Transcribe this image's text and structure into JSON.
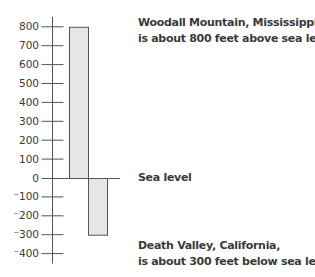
{
  "chart_data": {
    "type": "bar",
    "title": "",
    "xlabel": "",
    "ylabel": "",
    "categories": [
      "Woodall Mountain, Mississippi",
      "Death Valley, California"
    ],
    "values": [
      800,
      -300
    ],
    "ylim": [
      -400,
      800
    ],
    "yticks": [
      800,
      700,
      600,
      500,
      400,
      300,
      200,
      100,
      0,
      -100,
      -200,
      -300,
      -400
    ],
    "ytick_labels": [
      "800",
      "700",
      "600",
      "500",
      "400",
      "300",
      "200",
      "100",
      "0",
      "⁻100",
      "⁻200",
      "⁻300",
      "⁻400"
    ],
    "grid": false,
    "bar_fill": "#e6e6e6",
    "bar_stroke": "#555555",
    "annotations": [
      {
        "line1": "Woodall Mountain, Mississippi,",
        "line2": "is about 800 feet above sea level"
      },
      {
        "line1": "Sea level"
      },
      {
        "line1": "Death Valley, California,",
        "line2": "is about 300 feet below sea level"
      }
    ]
  },
  "labels": {
    "woodall_line1": "Woodall Mountain, Mississippi,",
    "woodall_line2": "is about 800 feet above sea level",
    "sea_level": "Sea level",
    "death_line1": "Death Valley, California,",
    "death_line2": "is about 300 feet below sea level"
  }
}
